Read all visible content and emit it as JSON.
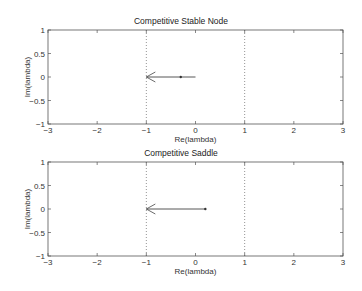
{
  "chart_data": [
    {
      "type": "line",
      "title": "Competitive Stable Node",
      "xlabel": "Re(lambda)",
      "ylabel": "Im(lambda)",
      "xlim": [
        -3,
        3
      ],
      "ylim": [
        -1,
        1
      ],
      "xticks": [
        "-3",
        "-2",
        "-1",
        "0",
        "1",
        "2",
        "3"
      ],
      "yticks": [
        "1",
        "0.5",
        "0",
        "-0.5",
        "-1"
      ],
      "reference_lines": [
        {
          "x": -1,
          "style": "dotted"
        },
        {
          "x": 1,
          "style": "dotted"
        }
      ],
      "arrow": {
        "from": [
          0,
          0
        ],
        "to": [
          -1,
          0
        ],
        "marker_at": [
          -0.3,
          0
        ]
      },
      "grid": false
    },
    {
      "type": "line",
      "title": "Competitive Saddle",
      "xlabel": "Re(lambda)",
      "ylabel": "Im(lambda)",
      "xlim": [
        -3,
        3
      ],
      "ylim": [
        -1,
        1
      ],
      "xticks": [
        "-3",
        "-2",
        "-1",
        "0",
        "1",
        "2",
        "3"
      ],
      "yticks": [
        "1",
        "0.5",
        "0",
        "-0.5",
        "-1"
      ],
      "reference_lines": [
        {
          "x": -1,
          "style": "dotted"
        },
        {
          "x": 1,
          "style": "dotted"
        }
      ],
      "arrow": {
        "from": [
          0.2,
          0
        ],
        "to": [
          -1,
          0
        ],
        "marker_at": [
          0.2,
          0
        ]
      },
      "grid": false
    }
  ],
  "plots": [
    {
      "title": "Competitive Stable Node",
      "xlabel": "Re(lambda)",
      "ylabel": "Im(lambda)"
    },
    {
      "title": "Competitive Saddle",
      "xlabel": "Re(lambda)",
      "ylabel": "Im(lambda)"
    }
  ]
}
